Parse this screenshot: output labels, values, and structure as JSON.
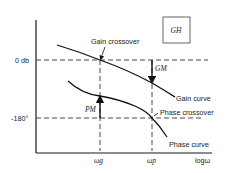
{
  "diagram": {
    "box_label": "GH",
    "y_axis_labels": {
      "zero_db": "0 db",
      "minus_180": "-180°"
    },
    "x_axis_labels": {
      "omega_g": "ωg",
      "omega_p": "ωp",
      "axis_name": "logω"
    },
    "annotations": {
      "gain_crossover": "Gain crossover",
      "phase_crossover": "Phase crossover",
      "gain_curve": "Gain curve",
      "phase_curve": "Phase curve",
      "gain_margin": "GM",
      "phase_margin": "PM"
    },
    "colors": {
      "line": "#1a1a1a",
      "dashed": "#333333",
      "background": "#ffffff"
    }
  }
}
